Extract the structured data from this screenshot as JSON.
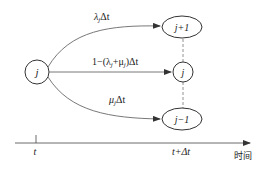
{
  "diagram": {
    "source_state": "j",
    "target_states": {
      "up": "j+1",
      "same": "j",
      "down": "j−1"
    },
    "transitions": {
      "up": {
        "label_main": "λ",
        "label_sub": "j",
        "label_tail": "Δt"
      },
      "same": {
        "label_main": "1−(λ",
        "label_sub1": "j",
        "label_mid": "+μ",
        "label_sub2": "j",
        "label_tail": ")Δt"
      },
      "down": {
        "label_main": "μ",
        "label_sub": "j",
        "label_tail": "Δt"
      }
    },
    "axis": {
      "start_label": "t",
      "end_label": "t+Δt",
      "axis_title": "时间"
    }
  }
}
